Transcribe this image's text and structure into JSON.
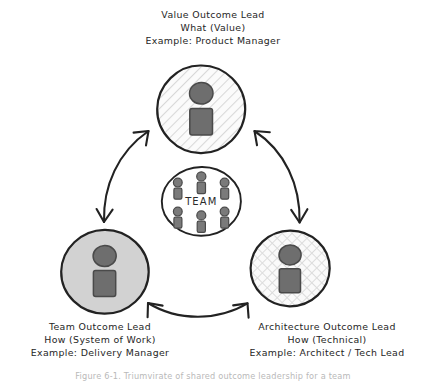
{
  "diagram": {
    "title_role_top": {
      "role": "Value Outcome Lead",
      "focus": "What (Value)",
      "example": "Example: Product Manager"
    },
    "role_bottom_left": {
      "role": "Team Outcome Lead",
      "focus": "How (System of Work)",
      "example": "Example: Delivery Manager"
    },
    "role_bottom_right": {
      "role": "Architecture Outcome Lead",
      "focus": "How (Technical)",
      "example": "Example: Architect / Tech Lead"
    },
    "center": {
      "label": "TEAM",
      "member_count": 6
    },
    "caption": "Figure 6-1. Triumvirate of shared outcome leadership for a team",
    "colors": {
      "ink": "#2b2b2b",
      "node_fill_solid": "#d2d2d2",
      "node_fill_hatch": "#f2f2f2",
      "person": "#6e6e6e",
      "person_outline": "#4a4a4a",
      "caption": "#b9b9b9"
    },
    "connectors": [
      {
        "name": "team-to-value",
        "direction": "bidirectional"
      },
      {
        "name": "value-to-architecture",
        "direction": "bidirectional"
      },
      {
        "name": "team-to-architecture",
        "direction": "bidirectional"
      }
    ]
  }
}
